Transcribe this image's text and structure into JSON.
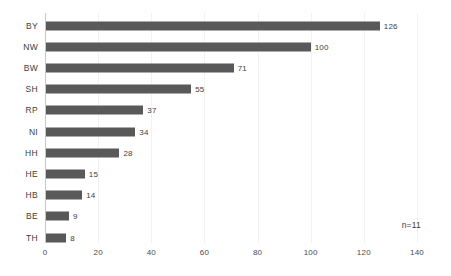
{
  "chart_data": {
    "type": "bar",
    "orientation": "horizontal",
    "title": "",
    "xlabel": "",
    "ylabel": "",
    "categories": [
      "BY",
      "NW",
      "BW",
      "SH",
      "RP",
      "NI",
      "HH",
      "HE",
      "HB",
      "BE",
      "TH"
    ],
    "values": [
      126,
      100,
      71,
      55,
      37,
      34,
      28,
      15,
      14,
      9,
      8
    ],
    "xlim": [
      0,
      140
    ],
    "xticks": [
      0,
      20,
      40,
      60,
      80,
      100,
      120,
      140
    ],
    "xtick_labels": [
      "0",
      "20",
      "40",
      "60",
      "80",
      "100",
      "120",
      "140"
    ],
    "grid": true,
    "legend": null,
    "data_labels": true,
    "annotation": "n=11",
    "colors": {
      "bar": "#595959",
      "grid": "#f2f2f2",
      "axis": "#c8c8c8",
      "text": "#3d3d3d",
      "background": "#ffffff"
    }
  }
}
